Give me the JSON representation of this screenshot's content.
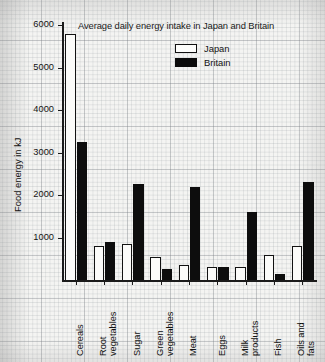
{
  "chart_data": {
    "type": "bar",
    "title": "Average daily energy intake in Japan and Britain",
    "xlabel": "",
    "ylabel": "Food energy in kJ",
    "categories": [
      "Cereals",
      "Root vegetables",
      "Sugar",
      "Green vegetables",
      "Meat",
      "Eggs",
      "Milk products",
      "Fish",
      "Oils and fats"
    ],
    "series": [
      {
        "name": "Japan",
        "values": [
          5800,
          800,
          850,
          550,
          350,
          300,
          300,
          600,
          800
        ]
      },
      {
        "name": "Britain",
        "values": [
          3250,
          900,
          2250,
          250,
          2200,
          300,
          1600,
          150,
          2300
        ]
      }
    ],
    "ylim": [
      0,
      6000
    ],
    "yticks": [
      1000,
      2000,
      3000,
      4000,
      5000,
      6000
    ],
    "ytick_labels": [
      "1000",
      "2000",
      "3000",
      "4000",
      "5000",
      "6000"
    ],
    "grid": true,
    "legend_position": "top-right",
    "colors": {
      "japan": "#fbfbf9",
      "britain": "#0d0d0d",
      "axis": "#1b1b1b"
    }
  },
  "legend": {
    "items": [
      {
        "label": "Japan",
        "style": "japan"
      },
      {
        "label": "Britain",
        "style": "britain"
      }
    ]
  }
}
